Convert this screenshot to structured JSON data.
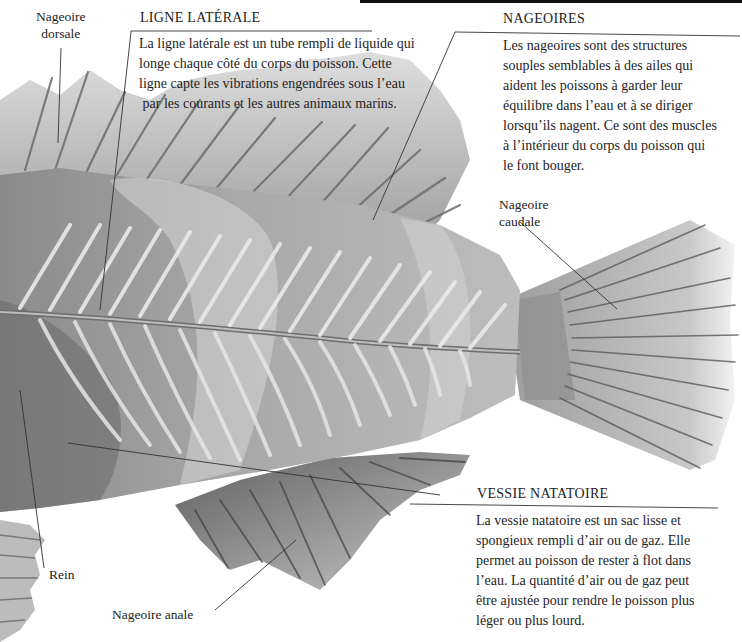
{
  "figure": {
    "palette": {
      "background": "#ffffff",
      "body_dark": "#7d7d7d",
      "body_mid": "#a3a3a3",
      "body_light": "#d2d2d2",
      "bone": "#eeeeee",
      "leader_line": "#333333",
      "text": "#1e1e1e"
    }
  },
  "labels": {
    "dorsal_fin": "Nageoire\ndorsale",
    "dorsal_fin_line1": "Nageoire",
    "dorsal_fin_line2": "dorsale",
    "caudal_fin_line1": "Nageoire",
    "caudal_fin_line2": "caudale",
    "kidney": "Rein",
    "anal_fin": "Nageoire anale"
  },
  "callouts": {
    "lateral_line": {
      "heading": "LIGNE LATÉRALE",
      "lines": [
        "La ligne latérale est un tube rempli de liquide qui",
        "longe chaque côté du corps du poisson. Cette",
        "ligne capte les vibrations engendrées sous l’eau",
        " par les courants et les autres animaux marins."
      ]
    },
    "fins": {
      "heading": "NAGEOIRES",
      "lines": [
        "Les nageoires sont des structures",
        "souples semblables à des ailes qui",
        "aident les poissons à garder leur",
        "équilibre dans l’eau et à se diriger",
        "lorsqu’ils nagent. Ce sont des muscles",
        "à l’intérieur du corps du poisson qui",
        "le font bouger."
      ]
    },
    "swim_bladder": {
      "heading": "VESSIE NATATOIRE",
      "lines": [
        "La vessie natatoire est un sac lisse et",
        "spongieux rempli d’air ou de gaz. Elle",
        "permet au poisson de rester à flot dans",
        "l’eau. La quantité d’air ou de gaz peut",
        "être ajustée pour rendre le poisson plus",
        "léger ou plus lourd."
      ]
    }
  }
}
